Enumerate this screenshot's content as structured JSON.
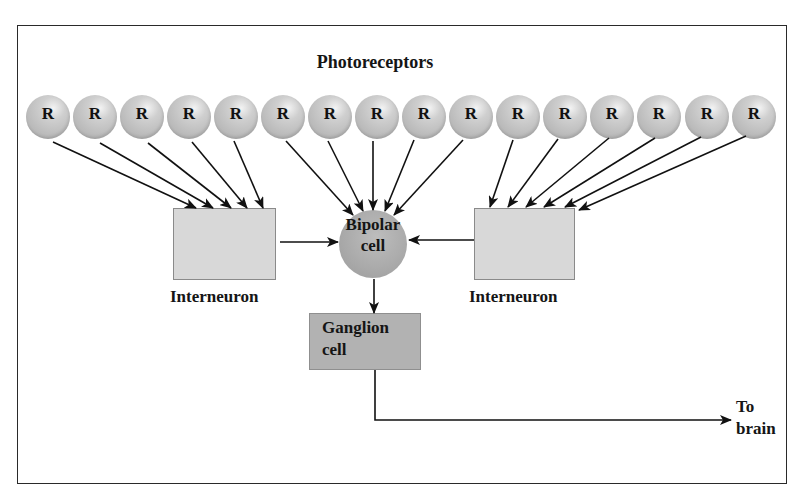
{
  "title": "Photoreceptors",
  "receptors": {
    "label": "R",
    "count": 16,
    "items": [
      "R",
      "R",
      "R",
      "R",
      "R",
      "R",
      "R",
      "R",
      "R",
      "R",
      "R",
      "R",
      "R",
      "R",
      "R",
      "R"
    ]
  },
  "nodes": {
    "interneuron_left": {
      "label": "Interneuron"
    },
    "bipolar": {
      "line1": "Bipolar",
      "line2": "cell"
    },
    "interneuron_right": {
      "label": "Interneuron"
    },
    "ganglion": {
      "line1": "Ganglion",
      "line2": "cell"
    },
    "output": {
      "line1": "To",
      "line2": "brain"
    }
  },
  "connections": {
    "receptors_1_5": "interneuron_left",
    "receptors_6_10": "bipolar",
    "receptors_11_16": "interneuron_right",
    "interneuron_left_to": "bipolar",
    "interneuron_right_to": "bipolar",
    "bipolar_to": "ganglion",
    "ganglion_to": "brain"
  },
  "colors": {
    "receptor_fill": "#c2c2c2",
    "interneuron_fill": "#d8d8d8",
    "bipolar_fill": "#a9a9a9",
    "ganglion_fill": "#b2b2b2",
    "line": "#111111"
  }
}
